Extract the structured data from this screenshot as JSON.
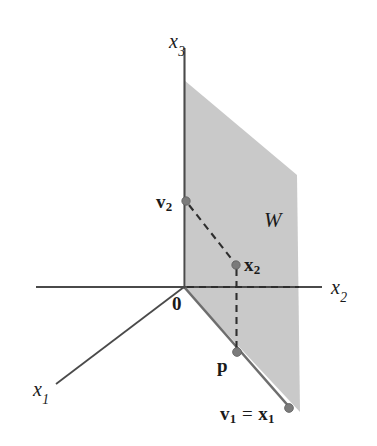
{
  "figure": {
    "width": 377,
    "height": 446,
    "background_color": "#ffffff"
  },
  "colors": {
    "plane_fill": "#c9c9c9",
    "axis_line": "#4a4a4a",
    "dashed_line": "#3a3a3a",
    "point_marker": "#7b7b7b",
    "text": "#1a1a1a"
  },
  "axes": [
    {
      "id": "x3",
      "label": "x",
      "subscript": "3",
      "direction": "vertical-up",
      "label_x": 169,
      "label_y": 31,
      "line": {
        "x1": 184,
        "y1": 48,
        "x2": 184,
        "y2": 287
      }
    },
    {
      "id": "x2",
      "label": "x",
      "subscript": "2",
      "direction": "horizontal-right",
      "label_x": 331,
      "label_y": 277,
      "line": {
        "x1": 36,
        "y1": 287,
        "x2": 322,
        "y2": 287
      }
    },
    {
      "id": "x1",
      "label": "x",
      "subscript": "1",
      "direction": "diagonal-down-left",
      "label_x": 33,
      "label_y": 379,
      "line": {
        "x1": 184,
        "y1": 287,
        "x2": 56,
        "y2": 384
      }
    }
  ],
  "plane": {
    "id": "W",
    "label": "W",
    "label_x": 264,
    "label_y": 210,
    "fill": "#c9c9c9",
    "vertices": "184,80 297,175 300,412 186,290"
  },
  "points": [
    {
      "id": "v2",
      "label": "v",
      "subscript": "2",
      "bold": true,
      "x": 186,
      "y": 201,
      "label_x": 156,
      "label_y": 192
    },
    {
      "id": "x2vec",
      "label": "x",
      "subscript": "2",
      "bold": true,
      "x": 236,
      "y": 265,
      "label_x": 244,
      "label_y": 255
    },
    {
      "id": "p",
      "label": "p",
      "subscript": "",
      "bold": true,
      "x": 237,
      "y": 352,
      "label_x": 217,
      "label_y": 356
    },
    {
      "id": "v1x1",
      "label": "v",
      "subscript": "1",
      "bold": true,
      "x": 289,
      "y": 408,
      "label_x": 220,
      "label_y": 404
    }
  ],
  "labels": {
    "x3_axis": "x",
    "x3_sub": "3",
    "x2_axis": "x",
    "x2_sub": "2",
    "x1_axis": "x",
    "x1_sub": "1",
    "plane_W": "W",
    "origin": "0",
    "v2_base": "v",
    "v2_sub": "2",
    "x2_base": "x",
    "x2_sub_pt": "2",
    "p_label": "p",
    "v1_base": "v",
    "v1_sub": "1",
    "equals": " = ",
    "x1_base": "x",
    "x1_sub_pt": "1"
  },
  "dashed_segments": [
    {
      "id": "v2-to-x2",
      "from": "v2",
      "to": "x2vec",
      "x1": 189,
      "y1": 204,
      "x2": 234,
      "y2": 262
    },
    {
      "id": "origin-to-x2",
      "from": "origin",
      "to": "x2vec",
      "x1": 186,
      "y1": 287,
      "x2": 299,
      "y2": 287
    },
    {
      "id": "x2-to-p",
      "from": "x2vec",
      "to": "p",
      "x1": 236,
      "y1": 268,
      "x2": 237,
      "y2": 349
    }
  ],
  "solid_segments": [
    {
      "id": "origin-to-v1",
      "from": "origin",
      "to": "v1x1",
      "x1": 185,
      "y1": 288,
      "x2": 289,
      "y2": 408
    }
  ]
}
